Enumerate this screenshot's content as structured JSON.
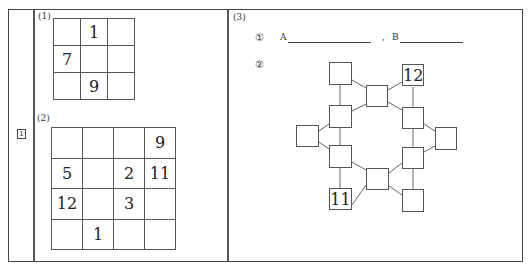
{
  "problem": {
    "number": "1"
  },
  "part1": {
    "label": "(1)",
    "grid": [
      [
        "",
        "1",
        ""
      ],
      [
        "7",
        "",
        ""
      ],
      [
        "",
        "9",
        ""
      ]
    ]
  },
  "part2": {
    "label": "(2)",
    "grid": [
      [
        "",
        "",
        "",
        "9"
      ],
      [
        "5",
        "",
        "2",
        "11"
      ],
      [
        "12",
        "",
        "3",
        ""
      ],
      [
        "",
        "1",
        "",
        ""
      ]
    ]
  },
  "part3": {
    "label": "(3)",
    "sub1": {
      "marker": "①",
      "a_label": "A",
      "separator": ",",
      "b_label": "B"
    },
    "sub2": {
      "marker": "②",
      "nodes": {
        "top_left": "",
        "top_center": "",
        "top_right": "12",
        "left_upper": "",
        "right_upper": "",
        "far_left": "",
        "far_right": "",
        "left_lower": "",
        "right_lower": "",
        "bottom_center": "",
        "bottom_left": "11",
        "bottom_right": ""
      }
    }
  }
}
